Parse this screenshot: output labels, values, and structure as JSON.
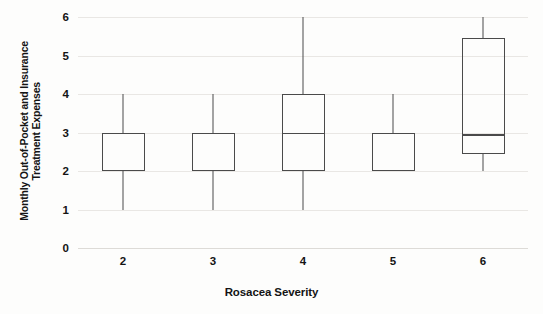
{
  "chart_data": {
    "type": "box",
    "title": "",
    "xlabel": "Rosacea Severity",
    "ylabel_line1": "Monthly Out-of-Pocket and Insurance",
    "ylabel_line2": "Treatment Expenses",
    "categories": [
      "2",
      "3",
      "4",
      "5",
      "6"
    ],
    "ylim": [
      0,
      6
    ],
    "yticks": [
      "0",
      "1",
      "2",
      "3",
      "4",
      "5",
      "6"
    ],
    "ytick_values": [
      0,
      1,
      2,
      3,
      4,
      5,
      6
    ],
    "grid": true,
    "legend": "none",
    "boxes": [
      {
        "category": "2",
        "whisker_low": 1,
        "q1": 2,
        "median": null,
        "q3": 3,
        "whisker_high": 4
      },
      {
        "category": "3",
        "whisker_low": 1,
        "q1": 2,
        "median": null,
        "q3": 3,
        "whisker_high": 4
      },
      {
        "category": "4",
        "whisker_low": 1,
        "q1": 2,
        "median": 3,
        "q3": 4,
        "whisker_high": 6
      },
      {
        "category": "5",
        "whisker_low": 2,
        "q1": 2,
        "median": null,
        "q3": 3,
        "whisker_high": 4
      },
      {
        "category": "6",
        "whisker_low": 2,
        "q1": 2.45,
        "median": 2.95,
        "q3": 5.45,
        "whisker_high": 6
      }
    ],
    "colors": {
      "line": "#4a4a4a",
      "grid": "#e9e7e4",
      "text": "#141414",
      "background": "#fdfdfc"
    }
  }
}
